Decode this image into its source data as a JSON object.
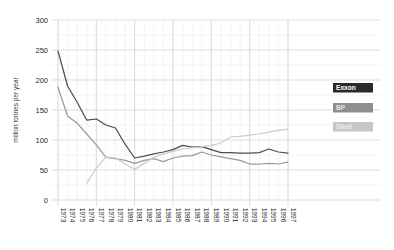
{
  "chart_data": {
    "type": "line",
    "title": "",
    "subtitle": "",
    "xlabel": "",
    "ylabel": "million tonnes per year",
    "ylim": [
      0,
      300
    ],
    "yticks": [
      0,
      50,
      100,
      150,
      200,
      250,
      300
    ],
    "grid": true,
    "legend_position": "right",
    "x": [
      1973,
      1974,
      1975,
      1976,
      1977,
      1978,
      1979,
      1980,
      1981,
      1982,
      1983,
      1984,
      1985,
      1986,
      1987,
      1988,
      1989,
      1990,
      1991,
      1992,
      1993,
      1994,
      1995,
      1996,
      1997
    ],
    "categories": [
      "1973",
      "1974",
      "1975",
      "1976",
      "1977",
      "1978",
      "1979",
      "1980",
      "1981",
      "1982",
      "1983",
      "1984",
      "1985",
      "1986",
      "1987",
      "1988",
      "1989",
      "1990",
      "1991",
      "1992",
      "1993",
      "1994",
      "1995",
      "1996",
      "1997"
    ],
    "series": [
      {
        "name": "Exxon",
        "color": "#4d4d4d",
        "values": [
          248,
          190,
          163,
          133,
          135,
          125,
          120,
          93,
          70,
          73,
          77,
          80,
          84,
          91,
          88,
          89,
          84,
          79,
          79,
          78,
          78,
          79,
          85,
          80,
          78
        ]
      },
      {
        "name": "BP",
        "color": "#9a9a9a",
        "values": [
          188,
          140,
          128,
          110,
          92,
          71,
          69,
          66,
          61,
          66,
          69,
          64,
          70,
          73,
          74,
          80,
          75,
          72,
          69,
          66,
          60,
          60,
          61,
          60,
          63
        ]
      },
      {
        "name": "Shell",
        "color": "#cccccc",
        "values": [
          null,
          null,
          null,
          28,
          53,
          72,
          70,
          60,
          51,
          61,
          71,
          77,
          81,
          85,
          87,
          89,
          91,
          95,
          105,
          106,
          108,
          110,
          113,
          116,
          118
        ]
      }
    ]
  },
  "axis": {
    "y_title": "million tonnes per year",
    "y_tick_labels": [
      "300",
      "250",
      "200",
      "150",
      "100",
      "50",
      "0"
    ],
    "x_tick_labels": [
      "1973",
      "1974",
      "1975",
      "1976",
      "1977",
      "1978",
      "1979",
      "1980",
      "1981",
      "1982",
      "1983",
      "1984",
      "1985",
      "1986",
      "1987",
      "1988",
      "1989",
      "1990",
      "1991",
      "1992",
      "1993",
      "1994",
      "1995",
      "1996",
      "1997"
    ]
  },
  "legend": {
    "items": [
      {
        "label": "Exxon",
        "bg": "#2b2b2b",
        "fg": "#ffffff"
      },
      {
        "label": "BP",
        "bg": "#8e8e8e",
        "fg": "#e8e8e8"
      },
      {
        "label": "Shell",
        "bg": "#c6c6c6",
        "fg": "#ededed"
      }
    ]
  },
  "colors": {
    "grid": "#d9d9d9",
    "minor_grid": "#eeeeee",
    "background": "#ffffff",
    "text": "#2b2b2b"
  }
}
